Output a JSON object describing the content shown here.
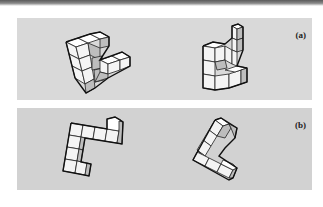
{
  "figure": {
    "type": "mental-rotation-stimuli",
    "panels": [
      {
        "id": "a",
        "label": "(a)",
        "description": "Two 3D block figures built from cubes, rotated versions of the same object",
        "background": "#d9d9d9"
      },
      {
        "id": "b",
        "label": "(b)",
        "description": "Two 3D block figures built from cubes, one rotated in the picture plane",
        "background": "#d2d2d2"
      }
    ]
  },
  "colors": {
    "cube_top": "#ffffff",
    "cube_side": "#bdbdbd",
    "cube_outline": "#222222"
  }
}
